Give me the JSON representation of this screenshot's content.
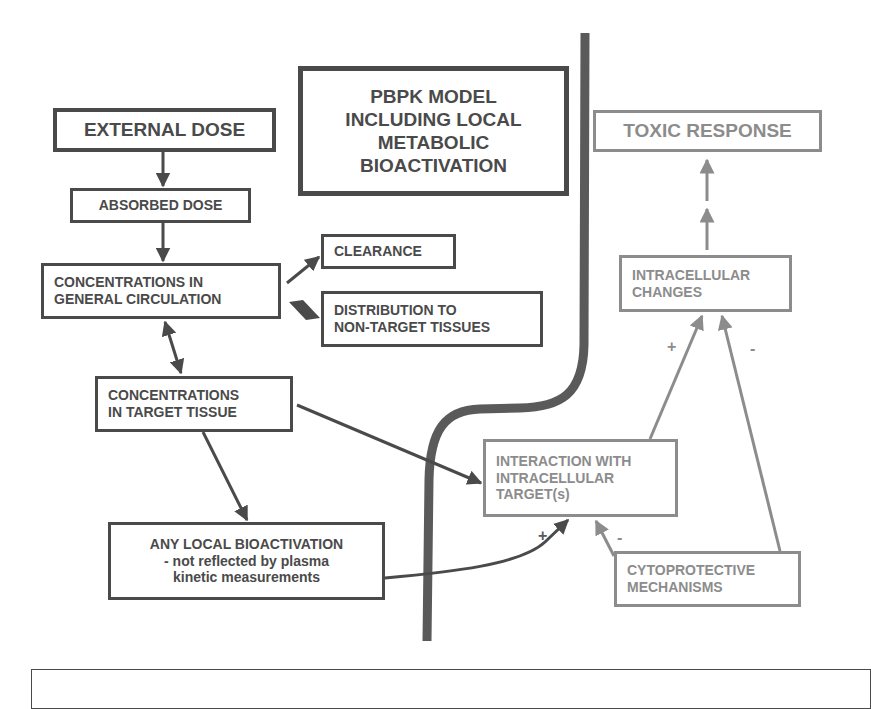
{
  "title_box": {
    "lines": [
      "PBPK MODEL",
      "INCLUDING LOCAL",
      "METABOLIC",
      "BIOACTIVATION"
    ]
  },
  "kinetic_side": {
    "external_dose": "EXTERNAL DOSE",
    "absorbed_dose": "ABSORBED DOSE",
    "general_circulation": [
      "CONCENTRATIONS IN",
      "GENERAL CIRCULATION"
    ],
    "clearance": "CLEARANCE",
    "distribution": [
      "DISTRIBUTION TO",
      "NON-TARGET TISSUES"
    ],
    "target_tissue": [
      "CONCENTRATIONS",
      "IN TARGET TISSUE"
    ],
    "local_bioactivation": [
      "ANY LOCAL BIOACTIVATION",
      "- not reflected by plasma",
      "kinetic measurements"
    ]
  },
  "dynamic_side": {
    "toxic_response": "TOXIC RESPONSE",
    "intracellular_changes": [
      "INTRACELLULAR",
      "CHANGES"
    ],
    "interaction": [
      "INTERACTION WITH",
      "INTRACELLULAR",
      "TARGET(s)"
    ],
    "cytoprotective": [
      "CYTOPROTECTIVE",
      "MECHANISMS"
    ]
  },
  "signs": {
    "bioactivation_to_interaction": "+",
    "cytoprotective_to_interaction": "-",
    "interaction_to_changes": "+",
    "cytoprotective_to_changes": "-"
  },
  "colors": {
    "kinetic": "#4a4a4a",
    "dynamic": "#8c8c8c",
    "divider": "#5a5a5a"
  }
}
